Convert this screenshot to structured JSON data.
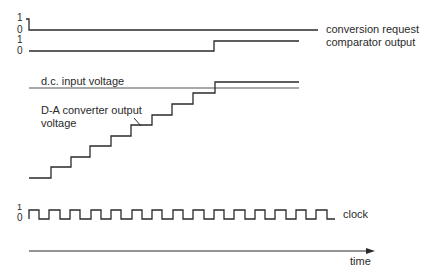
{
  "diagram": {
    "type": "timing-diagram",
    "signals": {
      "conversion_request": {
        "label": "conversion request",
        "level_high": "1",
        "level_low": "0"
      },
      "comparator_output": {
        "label": "comparator output",
        "level_high": "1",
        "level_low": "0"
      },
      "dc_input": {
        "label": "d.c. input voltage"
      },
      "da_output": {
        "label_line1": "D-A converter output",
        "label_line2": "voltage"
      },
      "clock": {
        "label": "clock",
        "level_high": "1",
        "level_low": "0"
      }
    },
    "time_axis": {
      "label": "time"
    },
    "staircase_steps": 10,
    "clock_pulses": 15,
    "colors": {
      "stroke": "#2a2a2a",
      "background": "#ffffff"
    }
  }
}
